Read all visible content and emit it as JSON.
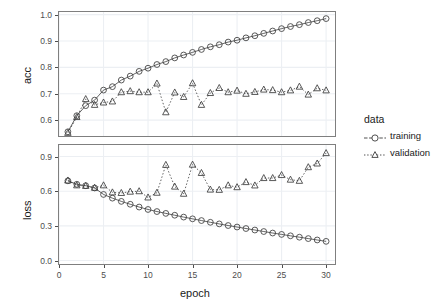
{
  "chart_data": [
    {
      "type": "line",
      "panel": "accuracy",
      "title": "",
      "xlabel": "",
      "ylabel": "acc",
      "xlim": [
        0.0,
        31.0
      ],
      "ylim": [
        0.54,
        1.01
      ],
      "xticks": [
        0,
        5,
        10,
        15,
        20,
        25,
        30
      ],
      "xticklabels": [
        "0",
        "5",
        "10",
        "15",
        "20",
        "25",
        "30"
      ],
      "yticks": [
        0.6,
        0.7,
        0.8,
        0.9,
        1.0
      ],
      "yticklabels": [
        "0.6",
        "0.7",
        "0.8",
        "0.9",
        "1.0"
      ],
      "grid": true,
      "legend_position": "right",
      "x": [
        1,
        2,
        3,
        4,
        5,
        6,
        7,
        8,
        9,
        10,
        11,
        12,
        13,
        14,
        15,
        16,
        17,
        18,
        19,
        20,
        21,
        22,
        23,
        24,
        25,
        26,
        27,
        28,
        29,
        30
      ],
      "series": [
        {
          "name": "training",
          "marker": "circle",
          "linestyle": "solid",
          "values": [
            0.556,
            0.617,
            0.655,
            0.676,
            0.714,
            0.727,
            0.752,
            0.767,
            0.785,
            0.797,
            0.811,
            0.822,
            0.836,
            0.847,
            0.857,
            0.868,
            0.878,
            0.886,
            0.896,
            0.903,
            0.912,
            0.92,
            0.929,
            0.938,
            0.947,
            0.955,
            0.962,
            0.97,
            0.977,
            0.985
          ]
        },
        {
          "name": "validation",
          "marker": "triangle",
          "linestyle": "dotted",
          "values": [
            0.552,
            0.612,
            0.68,
            0.658,
            0.667,
            0.671,
            0.706,
            0.71,
            0.706,
            0.706,
            0.739,
            0.63,
            0.705,
            0.688,
            0.74,
            0.658,
            0.703,
            0.722,
            0.706,
            0.712,
            0.7,
            0.707,
            0.716,
            0.714,
            0.706,
            0.713,
            0.727,
            0.697,
            0.721,
            0.713
          ]
        }
      ]
    },
    {
      "type": "line",
      "panel": "loss",
      "title": "",
      "xlabel": "epoch",
      "ylabel": "loss",
      "xlim": [
        0.0,
        31.0
      ],
      "ylim": [
        -0.03,
        1.0
      ],
      "xticks": [
        0,
        5,
        10,
        15,
        20,
        25,
        30
      ],
      "xticklabels": [
        "0",
        "5",
        "10",
        "15",
        "20",
        "25",
        "30"
      ],
      "yticks": [
        0.0,
        0.3,
        0.6,
        0.9
      ],
      "yticklabels": [
        "0.0",
        "0.3",
        "0.6",
        "0.9"
      ],
      "grid": true,
      "legend_position": "right",
      "x": [
        1,
        2,
        3,
        4,
        5,
        6,
        7,
        8,
        9,
        10,
        11,
        12,
        13,
        14,
        15,
        16,
        17,
        18,
        19,
        20,
        21,
        22,
        23,
        24,
        25,
        26,
        27,
        28,
        29,
        30
      ],
      "series": [
        {
          "name": "training",
          "marker": "circle",
          "linestyle": "solid",
          "values": [
            0.69,
            0.66,
            0.648,
            0.628,
            0.572,
            0.54,
            0.512,
            0.487,
            0.463,
            0.442,
            0.424,
            0.408,
            0.392,
            0.376,
            0.361,
            0.346,
            0.331,
            0.317,
            0.303,
            0.29,
            0.277,
            0.264,
            0.251,
            0.238,
            0.226,
            0.214,
            0.202,
            0.19,
            0.178,
            0.166
          ]
        },
        {
          "name": "validation",
          "marker": "triangle",
          "linestyle": "dotted",
          "values": [
            0.693,
            0.651,
            0.646,
            0.63,
            0.651,
            0.59,
            0.585,
            0.596,
            0.6,
            0.546,
            0.587,
            0.828,
            0.64,
            0.578,
            0.83,
            0.758,
            0.614,
            0.612,
            0.651,
            0.635,
            0.679,
            0.65,
            0.714,
            0.714,
            0.74,
            0.7,
            0.69,
            0.808,
            0.84,
            0.93
          ]
        }
      ]
    }
  ],
  "legend": {
    "title": "data",
    "entries": [
      {
        "label": "training",
        "marker": "circle",
        "linestyle": "solid"
      },
      {
        "label": "validation",
        "marker": "triangle",
        "linestyle": "dotted"
      }
    ]
  },
  "colors": {
    "line": "#3c3c3c",
    "marker_stroke": "#3c3c3c",
    "grid": "#eceff3",
    "panel_border": "#7f7f7f",
    "background": "#ffffff",
    "tick_label": "#4d4d4d",
    "axis_title": "#1a1a1a"
  },
  "axes": {
    "acc": {
      "label": "acc"
    },
    "loss": {
      "label": "loss"
    },
    "epoch": {
      "label": "epoch"
    }
  }
}
